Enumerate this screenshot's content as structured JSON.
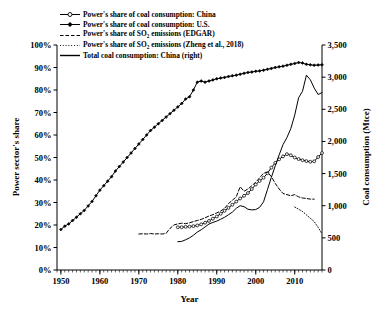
{
  "chart_data": {
    "type": "line",
    "title": "",
    "xlabel": "Year",
    "ylabel": "Power sector's share",
    "ylabel_right": "Coal consumption (Mtce)",
    "xlim": [
      1949,
      2017
    ],
    "ylim": [
      0,
      1.0
    ],
    "ylim_right": [
      0,
      3500
    ],
    "grid": false,
    "legend_position": "top-left",
    "x_ticks": [
      "1950",
      "1960",
      "1970",
      "1980",
      "1990",
      "2000",
      "2010"
    ],
    "x_tick_values": [
      1950,
      1960,
      1970,
      1980,
      1990,
      2000,
      2010
    ],
    "x_minor_tick_interval": 1,
    "y_ticks_left": [
      "0%",
      "10%",
      "20%",
      "30%",
      "40%",
      "50%",
      "60%",
      "70%",
      "80%",
      "90%",
      "100%"
    ],
    "y_tick_values_left": [
      0,
      10,
      20,
      30,
      40,
      50,
      60,
      70,
      80,
      90,
      100
    ],
    "y_ticks_right": [
      "0",
      "500",
      "1,000",
      "1,500",
      "2,000",
      "2,500",
      "3,000",
      "3,500"
    ],
    "y_tick_values_right": [
      0,
      500,
      1000,
      1500,
      2000,
      2500,
      3000,
      3500
    ],
    "series": [
      {
        "name": "Power's share of coal consumption: China",
        "axis": "left",
        "style": "solid-marker",
        "marker": "open-circle",
        "color": "#000000",
        "x": [
          1980,
          1981,
          1982,
          1983,
          1984,
          1985,
          1986,
          1987,
          1988,
          1989,
          1990,
          1991,
          1992,
          1993,
          1994,
          1995,
          1996,
          1997,
          1998,
          1999,
          2000,
          2001,
          2002,
          2003,
          2004,
          2005,
          2006,
          2007,
          2008,
          2009,
          2010,
          2011,
          2012,
          2013,
          2014,
          2015,
          2016,
          2017
        ],
        "values": [
          19.0,
          19.0,
          19.2,
          19.3,
          19.5,
          19.8,
          20.3,
          21.0,
          21.8,
          22.8,
          23.8,
          25.0,
          26.3,
          27.6,
          29.0,
          30.4,
          31.8,
          33.0,
          34.2,
          36.0,
          38.0,
          39.6,
          41.0,
          43.0,
          45.5,
          47.6,
          49.2,
          50.5,
          51.5,
          51.0,
          50.0,
          49.3,
          48.8,
          48.4,
          48.1,
          48.3,
          50.2,
          52.0
        ]
      },
      {
        "name": "Power's share of coal consumption: U.S.",
        "axis": "left",
        "style": "solid-marker",
        "marker": "filled-diamond",
        "color": "#000000",
        "x": [
          1950,
          1951,
          1952,
          1953,
          1954,
          1955,
          1956,
          1957,
          1958,
          1959,
          1960,
          1961,
          1962,
          1963,
          1964,
          1965,
          1966,
          1967,
          1968,
          1969,
          1970,
          1971,
          1972,
          1973,
          1974,
          1975,
          1976,
          1977,
          1978,
          1979,
          1980,
          1981,
          1982,
          1983,
          1984,
          1985,
          1986,
          1987,
          1988,
          1989,
          1990,
          1991,
          1992,
          1993,
          1994,
          1995,
          1996,
          1997,
          1998,
          1999,
          2000,
          2001,
          2002,
          2003,
          2004,
          2005,
          2006,
          2007,
          2008,
          2009,
          2010,
          2011,
          2012,
          2013,
          2014,
          2015,
          2016,
          2017
        ],
        "values": [
          18.0,
          19.5,
          20.5,
          22.0,
          23.5,
          25.0,
          26.5,
          28.5,
          30.5,
          33.0,
          35.5,
          37.5,
          39.5,
          41.5,
          44.0,
          46.0,
          48.0,
          50.0,
          52.0,
          54.0,
          56.0,
          58.0,
          60.0,
          62.0,
          63.5,
          65.0,
          66.5,
          68.0,
          69.5,
          71.0,
          72.5,
          74.0,
          76.0,
          77.0,
          80.0,
          83.5,
          84.0,
          83.5,
          84.0,
          84.5,
          85.0,
          85.3,
          85.6,
          86.0,
          86.3,
          86.6,
          87.0,
          87.4,
          87.8,
          88.0,
          88.3,
          88.5,
          88.8,
          89.2,
          89.6,
          90.0,
          90.3,
          90.6,
          91.0,
          91.4,
          91.8,
          92.2,
          92.0,
          91.4,
          91.2,
          91.0,
          91.1,
          91.2
        ]
      },
      {
        "name": "Power's share of SO2 emissions (EDGAR)",
        "axis": "left",
        "style": "dashed",
        "marker": "none",
        "color": "#000000",
        "x": [
          1970,
          1971,
          1972,
          1973,
          1974,
          1975,
          1976,
          1977,
          1978,
          1979,
          1980,
          1981,
          1982,
          1983,
          1984,
          1985,
          1986,
          1987,
          1988,
          1989,
          1990,
          1991,
          1992,
          1993,
          1994,
          1995,
          1996,
          1997,
          1998,
          1999,
          2000,
          2001,
          2002,
          2003,
          2004,
          2005,
          2006,
          2007,
          2008,
          2009,
          2010,
          2011,
          2012,
          2013,
          2014,
          2015
        ],
        "values": [
          16.0,
          16.1,
          16.0,
          16.2,
          16.0,
          16.1,
          16.0,
          16.3,
          18.5,
          20.0,
          20.5,
          20.8,
          20.6,
          21.0,
          21.5,
          22.0,
          22.5,
          23.2,
          24.0,
          24.6,
          25.4,
          26.2,
          27.4,
          29.5,
          31.0,
          32.5,
          37.0,
          35.0,
          36.0,
          37.5,
          39.0,
          41.0,
          43.0,
          43.5,
          41.5,
          38.5,
          36.0,
          34.0,
          33.5,
          33.0,
          33.5,
          32.5,
          32.0,
          31.8,
          31.5,
          31.5
        ]
      },
      {
        "name": "Power's share of SO2 emissions (Zheng et al., 2018)",
        "axis": "left",
        "style": "dotted",
        "marker": "none",
        "color": "#000000",
        "x": [
          2010,
          2011,
          2012,
          2013,
          2014,
          2015,
          2016,
          2017
        ],
        "values": [
          28.0,
          27.0,
          26.0,
          24.5,
          23.0,
          21.5,
          19.0,
          16.0
        ]
      },
      {
        "name": "Total coal consumption: China (right)",
        "axis": "right",
        "style": "solid",
        "marker": "none",
        "color": "#000000",
        "x": [
          1980,
          1981,
          1982,
          1983,
          1984,
          1985,
          1986,
          1987,
          1988,
          1989,
          1990,
          1991,
          1992,
          1993,
          1994,
          1995,
          1996,
          1997,
          1998,
          1999,
          2000,
          2001,
          2002,
          2003,
          2004,
          2005,
          2006,
          2007,
          2008,
          2009,
          2010,
          2011,
          2012,
          2013,
          2014,
          2015,
          2016,
          2017
        ],
        "values": [
          440,
          445,
          470,
          500,
          540,
          590,
          625,
          670,
          715,
          740,
          760,
          790,
          820,
          860,
          900,
          960,
          1000,
          985,
          945,
          935,
          940,
          975,
          1060,
          1250,
          1440,
          1620,
          1790,
          1950,
          2060,
          2200,
          2410,
          2680,
          2780,
          3030,
          2960,
          2830,
          2730,
          2760
        ]
      }
    ]
  },
  "axes": {
    "left_title": "Power sector's share",
    "right_title": "Coal consumption (Mtce)",
    "x_title": "Year"
  },
  "legend": {
    "items": [
      {
        "label": "Power's share of coal consumption: China",
        "style": "solid-marker",
        "marker": "open-circle"
      },
      {
        "label": "Power's share of coal consumption: U.S.",
        "style": "solid-marker",
        "marker": "filled-diamond"
      },
      {
        "label_pre": "Power's share of SO",
        "label_sub": "2",
        "label_post": " emissions (EDGAR)",
        "style": "dashed",
        "marker": "none"
      },
      {
        "label_pre": "Power's share of SO",
        "label_sub": "2",
        "label_post": " emissions (Zheng et al., 2018)",
        "style": "dotted",
        "marker": "none"
      },
      {
        "label": "Total coal consumption: China (right)",
        "style": "solid",
        "marker": "none"
      }
    ]
  }
}
